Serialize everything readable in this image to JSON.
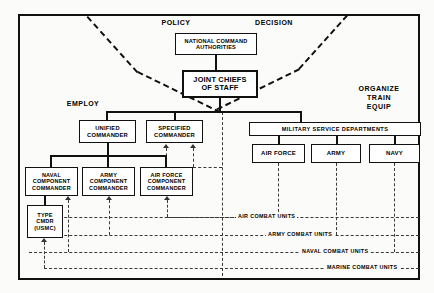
{
  "diagram": {
    "title_labels": {
      "policy": "POLICY",
      "decision": "DECISION",
      "employ": "EMPLOY",
      "organize_train_equip": "ORGANIZE\nTRAIN\nEQUIP"
    },
    "zone_labels": [
      {
        "id": "policy",
        "text": "POLICY"
      },
      {
        "id": "decision",
        "text": "DECISION"
      },
      {
        "id": "employ",
        "text": "EMPLOY"
      },
      {
        "id": "organize",
        "text": "ORGANIZE"
      },
      {
        "id": "train",
        "text": "TRAIN"
      },
      {
        "id": "equip",
        "text": "EQUIP"
      }
    ],
    "nodes": [
      {
        "id": "nca",
        "line1": "NATIONAL COMMAND",
        "line2": "AUTHORITIES"
      },
      {
        "id": "jcs",
        "line1": "JOINT CHIEFS",
        "line2": "OF STAFF"
      },
      {
        "id": "unified",
        "line1": "UNIFIED",
        "line2": "COMMANDER"
      },
      {
        "id": "specified",
        "line1": "SPECIFIED",
        "line2": "COMMANDER"
      },
      {
        "id": "msd",
        "line1": "MILITARY SERVICE DEPARTMENTS"
      },
      {
        "id": "airforce",
        "line1": "AIR FORCE"
      },
      {
        "id": "army",
        "line1": "ARMY"
      },
      {
        "id": "navy",
        "line1": "NAVY"
      },
      {
        "id": "naval_comp",
        "line1": "NAVAL",
        "line2": "COMPONENT",
        "line3": "COMMANDER"
      },
      {
        "id": "army_comp",
        "line1": "ARMY",
        "line2": "COMPONENT",
        "line3": "COMMANDER"
      },
      {
        "id": "af_comp",
        "line1": "AIR FORCE",
        "line2": "COMPONENT",
        "line3": "COMMANDER"
      },
      {
        "id": "type_cmdr",
        "line1": "TYPE",
        "line2": "CMDR",
        "line3": "(USMC)"
      }
    ],
    "combat_unit_lines": [
      {
        "id": "air",
        "text": "AIR COMBAT UNITS"
      },
      {
        "id": "army",
        "text": "ARMY COMBAT UNITS"
      },
      {
        "id": "naval",
        "text": "NAVAL COMBAT UNITS"
      },
      {
        "id": "marine",
        "text": "MARINE COMBAT UNITS"
      }
    ],
    "colors": {
      "ink": "#111111",
      "dashed": "#3a3a3a",
      "paper": "#fbfbfa"
    }
  }
}
